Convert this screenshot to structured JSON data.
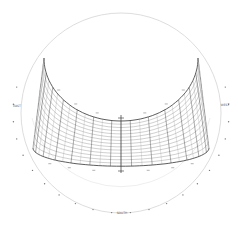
{
  "diagram": {
    "type": "sun-path-chart",
    "colors": {
      "background": "#ffffff",
      "outer_circle": "#d0d0d0",
      "grid_major": "#333333",
      "grid_minor": "#8a8a8a",
      "ticks": "#666666",
      "labels": "#555555"
    },
    "labels": {
      "east": "EAST",
      "west": "WEST",
      "south": "SOUTH"
    },
    "hour_labels_left": [
      "",
      "",
      "",
      ""
    ],
    "hour_labels_right": [
      "",
      "",
      "",
      ""
    ]
  }
}
